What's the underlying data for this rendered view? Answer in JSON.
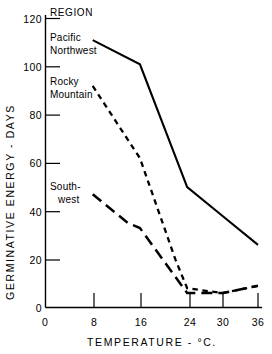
{
  "chart_data": {
    "type": "line",
    "title": "",
    "xlabel": "TEMPERATURE - °C.",
    "ylabel": "GERMINATIVE ENERGY - DAYS",
    "xlim": [
      0,
      36
    ],
    "ylim": [
      0,
      120
    ],
    "xticks": [
      "0",
      "8",
      "16",
      "24",
      "30",
      "36"
    ],
    "yticks": [
      "0",
      "20",
      "40",
      "60",
      "80",
      "100",
      "120"
    ],
    "grid": false,
    "legend_position": "inside-upper-left",
    "legend_title": "REGION",
    "series": [
      {
        "name": "Pacific Northwest",
        "label_line1": "Pacific",
        "label_line2": "Northwest",
        "style": "solid",
        "x": [
          8,
          16,
          24,
          30,
          36
        ],
        "values": [
          111,
          101,
          50,
          38,
          26
        ]
      },
      {
        "name": "Rocky Mountain",
        "label_line1": "Rocky",
        "label_line2": "Mountain",
        "style": "short-dashed",
        "x": [
          8,
          16,
          22,
          24,
          30,
          36
        ],
        "values": [
          92,
          62,
          20,
          8,
          6,
          9
        ]
      },
      {
        "name": "Southwest",
        "label_line1": "South-",
        "label_line2": "west",
        "style": "long-dashed",
        "x": [
          8,
          14,
          16,
          24,
          30,
          36
        ],
        "values": [
          47,
          35,
          33,
          6,
          6,
          9
        ]
      }
    ]
  },
  "colors": {
    "line": "#000000",
    "background": "#ffffff",
    "axis": "#000000"
  }
}
